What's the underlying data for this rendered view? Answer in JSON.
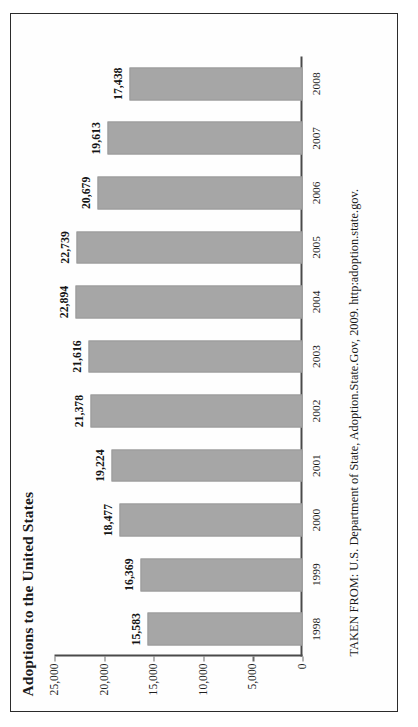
{
  "page": {
    "frame_border_color": "#2b2b2b",
    "background_color": "#ffffff"
  },
  "figure": {
    "title": "Adoptions to the United States",
    "source_note": "TAKEN FROM: U.S. Department of State, Adoption.State.Gov, 2009. http:adoption.state.gov.",
    "bar_color": "#a6a6a6",
    "axis_color": "#4a4a4a",
    "orientation": "rotated-90-ccw"
  },
  "chart_data": {
    "type": "bar",
    "title": "Adoptions to the United States",
    "xlabel": "",
    "ylabel": "",
    "ylim": [
      0,
      25000
    ],
    "yticks": [
      0,
      5000,
      10000,
      15000,
      20000,
      25000
    ],
    "ytick_labels": [
      "0",
      "5,000",
      "10,000",
      "15,000",
      "20,000",
      "25,000"
    ],
    "grid": false,
    "legend": false,
    "categories": [
      "1998",
      "1999",
      "2000",
      "2001",
      "2002",
      "2003",
      "2004",
      "2005",
      "2006",
      "2007",
      "2008"
    ],
    "values": [
      15583,
      16369,
      18477,
      19224,
      21378,
      21616,
      22894,
      22739,
      20679,
      19613,
      17438
    ],
    "value_labels": [
      "15,583",
      "16,369",
      "18,477",
      "19,224",
      "21,378",
      "21,616",
      "22,894",
      "22,739",
      "20,679",
      "19,613",
      "17,438"
    ],
    "annotations": [
      "TAKEN FROM: U.S. Department of State, Adoption.State.Gov, 2009. http:adoption.state.gov."
    ]
  }
}
